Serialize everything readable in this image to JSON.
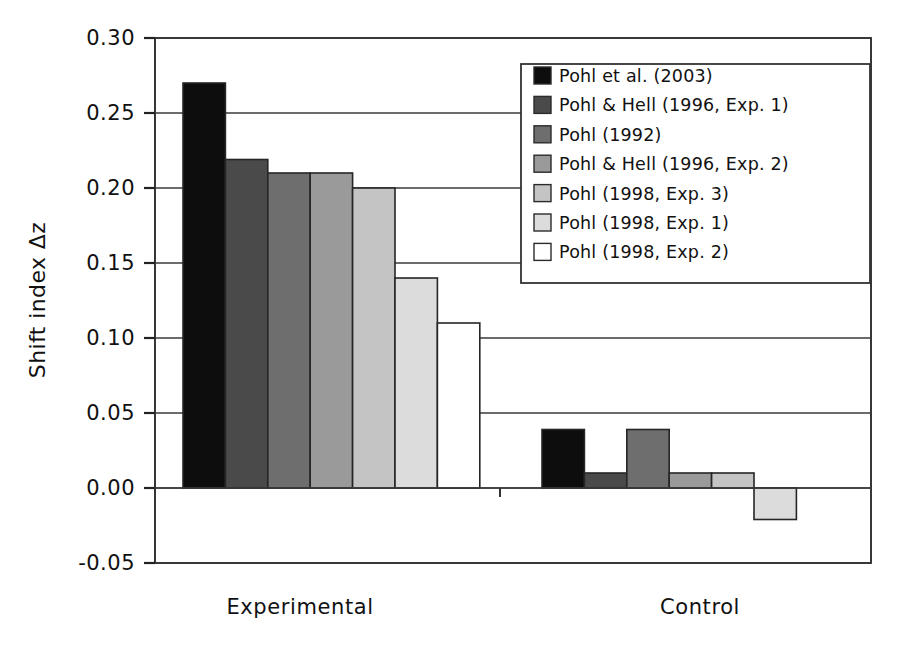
{
  "chart_data": {
    "type": "bar",
    "title": "",
    "xlabel": "",
    "ylabel": "Shift index Δz",
    "ylim": [
      -0.05,
      0.3
    ],
    "ytick_labels": [
      "0.30",
      "0.25",
      "0.20",
      "0.15",
      "0.10",
      "0.05",
      "0.00",
      "-0.05"
    ],
    "ytick_values": [
      0.3,
      0.25,
      0.2,
      0.15,
      0.1,
      0.05,
      0.0,
      -0.05
    ],
    "categories": [
      "Experimental",
      "Control"
    ],
    "grid": "horizontal",
    "legend_position": "upper-right-inside",
    "series": [
      {
        "name": "Pohl et al. (2003)",
        "color": "#0d0d0d",
        "values": [
          0.27,
          0.039
        ]
      },
      {
        "name": "Pohl & Hell (1996, Exp. 1)",
        "color": "#4a4a4a",
        "values": [
          0.219,
          0.01
        ]
      },
      {
        "name": "Pohl (1992)",
        "color": "#6e6e6e",
        "values": [
          0.21,
          0.039
        ]
      },
      {
        "name": "Pohl & Hell (1996, Exp. 2)",
        "color": "#9a9a9a",
        "values": [
          0.21,
          0.01
        ]
      },
      {
        "name": "Pohl (1998, Exp. 3)",
        "color": "#c4c4c4",
        "values": [
          0.2,
          0.01
        ]
      },
      {
        "name": "Pohl (1998, Exp. 1)",
        "color": "#dcdcdc",
        "values": [
          0.14,
          -0.021
        ]
      },
      {
        "name": "Pohl (1998, Exp. 2)",
        "color": "#ffffff",
        "values": [
          0.11,
          null
        ]
      }
    ]
  },
  "legend": {
    "entries": [
      "Pohl et al. (2003)",
      "Pohl & Hell (1996, Exp. 1)",
      "Pohl (1992)",
      "Pohl & Hell (1996, Exp. 2)",
      "Pohl (1998, Exp. 3)",
      "Pohl (1998, Exp. 1)",
      "Pohl (1998, Exp. 2)"
    ]
  },
  "axes": {
    "y_title": "Shift index Δz",
    "y_ticks": [
      "0.30",
      "0.25",
      "0.20",
      "0.15",
      "0.10",
      "0.05",
      "0.00",
      "-0.05"
    ],
    "x_categories": [
      "Experimental",
      "Control"
    ]
  }
}
